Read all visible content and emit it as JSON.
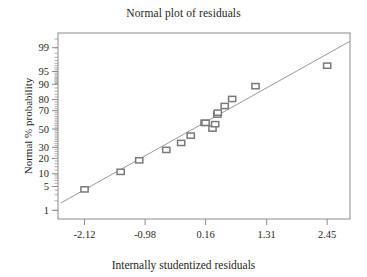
{
  "chart_data": {
    "type": "scatter",
    "title": "Normal plot of residuals",
    "xlabel": "Internally studentized residuals",
    "ylabel": "Normal % probability",
    "xticklabels": [
      "-2.12",
      "-0.98",
      "0.16",
      "1.31",
      "2.45"
    ],
    "xtickvalues": [
      -2.12,
      -0.98,
      0.16,
      1.31,
      2.45
    ],
    "yticklabels": [
      "99",
      "95",
      "90",
      "80",
      "70",
      "50",
      "30",
      "20",
      "10",
      "5",
      "1"
    ],
    "ytickvalues": [
      99,
      95,
      90,
      80,
      70,
      50,
      30,
      20,
      10,
      5,
      1
    ],
    "xlim": [
      -2.62,
      2.88
    ],
    "ylim": [
      0.5,
      99.7
    ],
    "grid": false,
    "legend": null,
    "marker": "open-square",
    "marker_color": "#7a7a7a",
    "line_color": "#9a9a9a",
    "axis_color": "#8c8c8c",
    "points": [
      {
        "x": -2.12,
        "y": 4.2
      },
      {
        "x": -1.44,
        "y": 11.0
      },
      {
        "x": -1.09,
        "y": 18.5
      },
      {
        "x": -0.58,
        "y": 27.5
      },
      {
        "x": -0.3,
        "y": 34.5
      },
      {
        "x": -0.12,
        "y": 42.5
      },
      {
        "x": 0.14,
        "y": 57.0
      },
      {
        "x": 0.16,
        "y": 57.0
      },
      {
        "x": 0.29,
        "y": 50.5
      },
      {
        "x": 0.34,
        "y": 55.5
      },
      {
        "x": 0.38,
        "y": 66.0
      },
      {
        "x": 0.39,
        "y": 68.0
      },
      {
        "x": 0.52,
        "y": 74.5
      },
      {
        "x": 0.66,
        "y": 80.5
      },
      {
        "x": 1.1,
        "y": 89.0
      },
      {
        "x": 2.45,
        "y": 96.5
      }
    ],
    "reference_line": {
      "x1": -2.57,
      "y1": 1.7,
      "x2": 2.88,
      "y2": 99.4
    }
  },
  "axes": {
    "plot_box": {
      "left": 58,
      "top": 33,
      "right": 350,
      "bottom": 219
    }
  }
}
